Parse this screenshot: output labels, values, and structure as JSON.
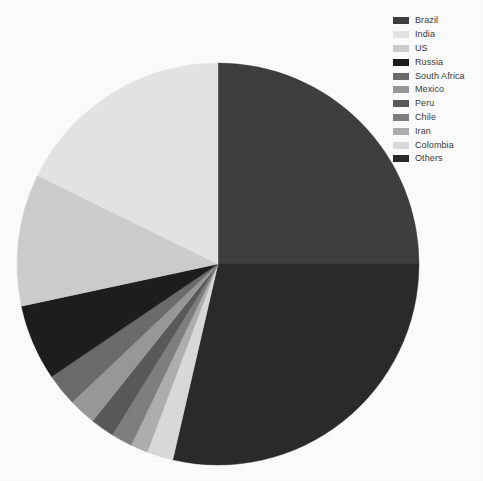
{
  "chart_data": {
    "type": "pie",
    "title": "",
    "subtitle": "",
    "xlabel": "",
    "ylabel": "",
    "legend_position": "top-right",
    "grid": false,
    "center": {
      "x": 218,
      "y": 264,
      "r": 201
    },
    "start_angle_deg": 0,
    "direction": "clockwise",
    "categories": [
      "Brazil",
      "India",
      "US",
      "Russia",
      "South Africa",
      "Mexico",
      "Peru",
      "Chile",
      "Iran",
      "Colombia",
      "Others"
    ],
    "values": [
      25.0,
      17.8,
      10.6,
      6.1,
      2.6,
      2.2,
      1.9,
      1.7,
      1.4,
      2.1,
      28.6
    ],
    "colors": [
      "#3f3f3f",
      "#e6e6e6",
      "#cfcfcf",
      "#1e1e1e",
      "#6d6d6d",
      "#9a9a9a",
      "#5a5a5a",
      "#808080",
      "#b0b0b0",
      "#dcdcdc",
      "#2b2b2b"
    ],
    "slices": [
      {
        "label": "Brazil",
        "value": 25.0,
        "color": "#3f3f3f",
        "start_deg": 0.0,
        "end_deg": 90.0
      },
      {
        "label": "Others",
        "value": 28.6,
        "color": "#2b2b2b",
        "start_deg": 90.0,
        "end_deg": 193.0
      },
      {
        "label": "Colombia",
        "value": 2.1,
        "color": "#dcdcdc",
        "start_deg": 193.0,
        "end_deg": 200.6
      },
      {
        "label": "Iran",
        "value": 1.4,
        "color": "#b0b0b0",
        "start_deg": 200.6,
        "end_deg": 205.6
      },
      {
        "label": "Chile",
        "value": 1.7,
        "color": "#808080",
        "start_deg": 205.6,
        "end_deg": 211.7
      },
      {
        "label": "Peru",
        "value": 1.9,
        "color": "#5a5a5a",
        "start_deg": 211.7,
        "end_deg": 218.6
      },
      {
        "label": "Mexico",
        "value": 2.2,
        "color": "#9a9a9a",
        "start_deg": 218.6,
        "end_deg": 226.5
      },
      {
        "label": "South Africa",
        "value": 2.6,
        "color": "#6d6d6d",
        "start_deg": 226.5,
        "end_deg": 235.9
      },
      {
        "label": "Russia",
        "value": 6.1,
        "color": "#1e1e1e",
        "start_deg": 235.9,
        "end_deg": 257.9
      },
      {
        "label": "US",
        "value": 10.6,
        "color": "#cfcfcf",
        "start_deg": 257.9,
        "end_deg": 296.1
      },
      {
        "label": "India",
        "value": 17.8,
        "color": "#e6e6e6",
        "start_deg": 296.1,
        "end_deg": 360.0
      }
    ]
  },
  "legend": {
    "items": [
      {
        "label": "Brazil",
        "color": "#3f3f3f"
      },
      {
        "label": "India",
        "color": "#e6e6e6"
      },
      {
        "label": "US",
        "color": "#cfcfcf"
      },
      {
        "label": "Russia",
        "color": "#1e1e1e"
      },
      {
        "label": "South Africa",
        "color": "#6d6d6d"
      },
      {
        "label": "Mexico",
        "color": "#9a9a9a"
      },
      {
        "label": "Peru",
        "color": "#5a5a5a"
      },
      {
        "label": "Chile",
        "color": "#808080"
      },
      {
        "label": "Iran",
        "color": "#b0b0b0"
      },
      {
        "label": "Colombia",
        "color": "#dcdcdc"
      },
      {
        "label": "Others",
        "color": "#2b2b2b"
      }
    ]
  },
  "canvas": {
    "background": "#fefefe",
    "width": 483,
    "height": 481
  }
}
